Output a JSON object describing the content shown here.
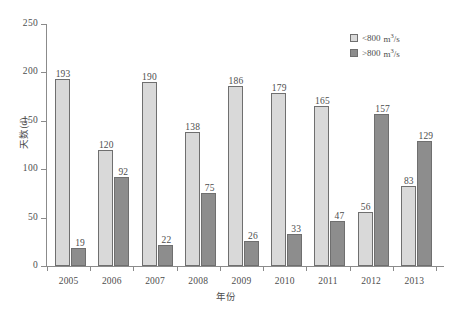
{
  "chart_data": {
    "type": "bar",
    "title": "",
    "xlabel": "年份",
    "ylabel": "天数(d)",
    "categories": [
      "2005",
      "2006",
      "2007",
      "2008",
      "2009",
      "2010",
      "2011",
      "2012",
      "2013"
    ],
    "series": [
      {
        "name": "<800 m3/s",
        "legend_prefix": "<800",
        "legend_unit_base": "m",
        "legend_unit_sup": "3",
        "legend_unit_tail": "/s",
        "color": "#d9d9d9",
        "values": [
          193,
          120,
          190,
          138,
          186,
          179,
          165,
          56,
          83
        ]
      },
      {
        "name": ">800 m3/s",
        "legend_prefix": ">800",
        "legend_unit_base": "m",
        "legend_unit_sup": "3",
        "legend_unit_tail": "/s",
        "color": "#8d8d8d",
        "values": [
          19,
          92,
          22,
          75,
          26,
          33,
          47,
          157,
          129
        ]
      }
    ],
    "ylim": [
      0,
      250
    ],
    "yticks": [
      0,
      50,
      100,
      150,
      200,
      250
    ],
    "ytick_labels": [
      "0",
      "50",
      "100",
      "150",
      "200",
      "250"
    ],
    "grid": false,
    "legend_position": "top-right",
    "axis_color": "#8b8b8b",
    "text_color": "#4d4d4d",
    "background": "#ffffff"
  }
}
